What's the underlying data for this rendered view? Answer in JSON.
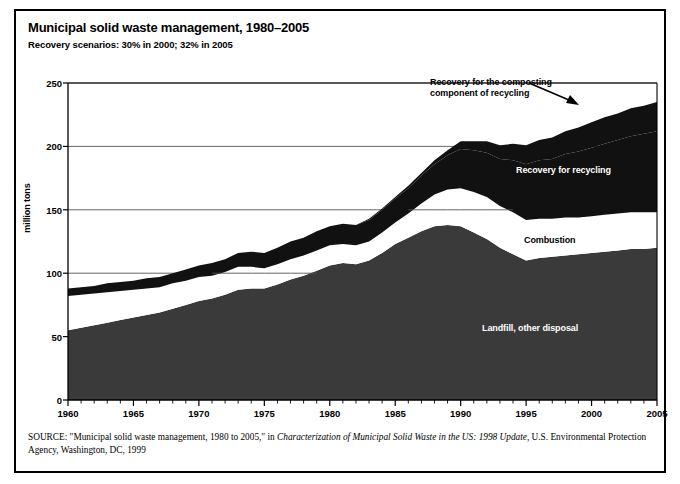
{
  "figure": {
    "title": "Municipal solid waste management, 1980–2005",
    "subtitle": "Recovery scenarios: 30% in 2000; 32% in 2005"
  },
  "source": {
    "label": "SOURCE",
    "part1": ": \"Municipal solid waste management, 1980 to 2005,\" in ",
    "italic1": "Characterization of Municipal Solid Waste in the US: 1998 Update",
    "part2": ", U.S. Environmental Protection Agency, Washington, DC, 1999"
  },
  "annotations": {
    "composting": "Recovery for the composting\ncomponent of recycling",
    "composting_line1": "Recovery for the composting",
    "composting_line2": "component of recycling",
    "recycling": "Recovery for recycling",
    "combustion": "Combustion",
    "landfill": "Landfill, other disposal"
  },
  "colors": {
    "landfill": "#3a3a3a",
    "combustion": "#ffffff",
    "recycling": "#111111",
    "composting": "#111111",
    "axis": "#000000",
    "grid": "#555555",
    "background": "#ffffff"
  },
  "chart_data": {
    "type": "area",
    "title": "Municipal solid waste management, 1980–2005",
    "subtitle": "Recovery scenarios: 30% in 2000; 32% in 2005",
    "xlabel": "",
    "ylabel": "million tons",
    "xlim": [
      1960,
      2005
    ],
    "ylim": [
      0,
      250
    ],
    "yticks": [
      0,
      50,
      100,
      150,
      200,
      250
    ],
    "xticks": [
      1960,
      1965,
      1970,
      1975,
      1980,
      1985,
      1990,
      1995,
      2000,
      2005
    ],
    "x_minor_tick_step": 1,
    "grid": "horizontal",
    "legend": "in-plot annotations",
    "stacked": true,
    "stack_order": [
      "Landfill, other disposal",
      "Combustion",
      "Recovery for recycling",
      "Recovery for the composting component of recycling"
    ],
    "x": [
      1960,
      1961,
      1962,
      1963,
      1964,
      1965,
      1966,
      1967,
      1968,
      1969,
      1970,
      1971,
      1972,
      1973,
      1974,
      1975,
      1976,
      1977,
      1978,
      1979,
      1980,
      1981,
      1982,
      1983,
      1984,
      1985,
      1986,
      1987,
      1988,
      1989,
      1990,
      1991,
      1992,
      1993,
      1994,
      1995,
      1996,
      1997,
      1998,
      1999,
      2000,
      2001,
      2002,
      2003,
      2004,
      2005
    ],
    "series": [
      {
        "name": "Landfill, other disposal",
        "values": [
          55,
          57,
          59,
          61,
          63,
          65,
          67,
          69,
          72,
          75,
          78,
          80,
          83,
          87,
          88,
          88,
          91,
          95,
          98,
          102,
          106,
          108,
          107,
          110,
          116,
          123,
          128,
          133,
          137,
          138,
          137,
          132,
          127,
          120,
          115,
          110,
          112,
          113,
          114,
          115,
          116,
          117,
          118,
          119,
          119,
          120
        ]
      },
      {
        "name": "Combustion",
        "values": [
          27,
          26,
          25,
          24,
          23,
          22,
          21,
          20,
          20,
          19,
          19,
          18,
          18,
          18,
          17,
          16,
          16,
          16,
          16,
          16,
          16,
          15,
          15,
          15,
          16,
          17,
          19,
          22,
          25,
          28,
          30,
          32,
          33,
          33,
          33,
          32,
          31,
          30,
          30,
          29,
          29,
          29,
          29,
          29,
          29,
          28
        ]
      },
      {
        "name": "Recovery for recycling",
        "values": [
          6,
          6,
          6,
          7,
          7,
          7,
          8,
          8,
          8,
          9,
          9,
          10,
          10,
          11,
          12,
          12,
          13,
          14,
          14,
          15,
          15,
          16,
          16,
          17,
          18,
          19,
          20,
          22,
          24,
          27,
          31,
          33,
          35,
          37,
          41,
          44,
          46,
          47,
          50,
          52,
          54,
          56,
          58,
          60,
          62,
          64
        ]
      },
      {
        "name": "Recovery for the composting component of recycling",
        "values": [
          0,
          0,
          0,
          0,
          0,
          0,
          0,
          0,
          0,
          0,
          0,
          0,
          0,
          0,
          0,
          0,
          0,
          0,
          0,
          0,
          0,
          0,
          0,
          1,
          1,
          1,
          2,
          2,
          3,
          4,
          6,
          7,
          9,
          11,
          13,
          15,
          16,
          17,
          18,
          19,
          20,
          21,
          21,
          22,
          22,
          23
        ]
      }
    ],
    "totals": [
      88,
      89,
      90,
      92,
      93,
      94,
      96,
      97,
      100,
      103,
      106,
      108,
      111,
      116,
      117,
      116,
      120,
      125,
      128,
      133,
      137,
      139,
      138,
      143,
      151,
      160,
      169,
      179,
      189,
      197,
      204,
      204,
      204,
      201,
      202,
      201,
      205,
      207,
      212,
      215,
      219,
      223,
      226,
      230,
      232,
      235
    ]
  }
}
